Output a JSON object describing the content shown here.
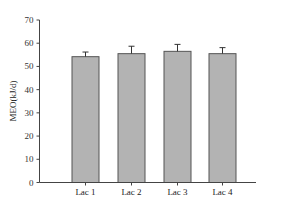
{
  "chart_data": {
    "type": "bar",
    "title": "",
    "xlabel": "",
    "ylabel": "MEO(kJ/d)",
    "ylim": [
      0,
      70
    ],
    "yticks": [
      0,
      10,
      20,
      30,
      40,
      50,
      60,
      70
    ],
    "grid": false,
    "legend": null,
    "categories": [
      "Lac 1",
      "Lac 2",
      "Lac 3",
      "Lac 4"
    ],
    "values": [
      54.2,
      55.5,
      56.5,
      55.5
    ],
    "error": [
      2.0,
      3.2,
      3.0,
      2.6
    ],
    "bar_color": "#b3b3b3",
    "bar_edge_color": "#555555"
  }
}
